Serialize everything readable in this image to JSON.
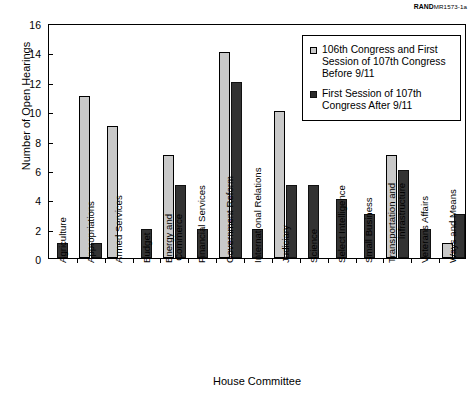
{
  "source_tag": {
    "mark": "RAND",
    "code": "MR1573-1a"
  },
  "legend": {
    "position": "top-right-inside",
    "entries": [
      {
        "label": "106th Congress and First Session of 107th Congress Before 9/11",
        "swatch": "light-gray-square",
        "color": "#c9c9c9"
      },
      {
        "label": "First Session of 107th Congress After 9/11",
        "swatch": "dark-gray-square",
        "color": "#333333"
      }
    ]
  },
  "chart_data": {
    "type": "bar",
    "title": "",
    "xlabel": "House Committee",
    "ylabel": "Number of Open Hearings",
    "ylim": [
      0,
      16
    ],
    "yticks": [
      0,
      2,
      4,
      6,
      8,
      10,
      12,
      14,
      16
    ],
    "grid": false,
    "categories": [
      "Agriculture",
      "Appropriations",
      "Armed Services",
      "Budget",
      "Energy and Commerce",
      "Financial Services",
      "Government Reform",
      "International Relations",
      "Judiciary",
      "Science",
      "Select Intelligence",
      "Small Business",
      "Transportation and Infrastructure",
      "Veterans Affairs",
      "Ways and Means"
    ],
    "category_lines": [
      [
        "Agriculture"
      ],
      [
        "Appropriations"
      ],
      [
        "Armed Services"
      ],
      [
        "Budget"
      ],
      [
        "Energy and",
        "Commerce"
      ],
      [
        "Financial Services"
      ],
      [
        "Government Reform"
      ],
      [
        "International Relations"
      ],
      [
        "Judiciary"
      ],
      [
        "Science"
      ],
      [
        "Select Intelligence"
      ],
      [
        "Small Business"
      ],
      [
        "Transportation and",
        "Infrastructure"
      ],
      [
        "Veterans Affairs"
      ],
      [
        "Ways and Means"
      ]
    ],
    "series": [
      {
        "name": "106th Congress and First Session of 107th Congress Before 9/11",
        "color": "#c9c9c9",
        "values": [
          0,
          11,
          9,
          0,
          7,
          0,
          14,
          0,
          10,
          0,
          0,
          0,
          7,
          0,
          1
        ]
      },
      {
        "name": "First Session of 107th Congress After 9/11",
        "color": "#333333",
        "values": [
          1,
          1,
          0,
          2,
          5,
          2,
          12,
          2,
          5,
          5,
          4,
          3,
          6,
          2,
          3
        ]
      }
    ]
  }
}
